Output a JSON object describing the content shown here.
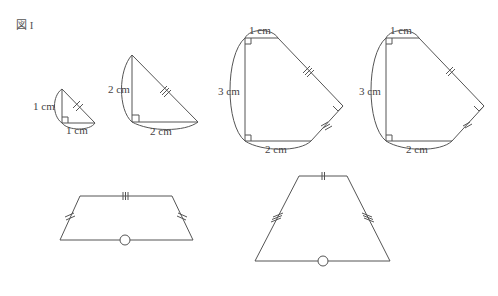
{
  "figure": {
    "title": "図 I",
    "colors": {
      "stroke": "#555555",
      "text": "#444444",
      "background": "#ffffff"
    }
  },
  "shapes": {
    "small_triangle": {
      "leg_vertical": "1 cm",
      "leg_horizontal": "1 cm",
      "hypotenuse_mark": "double-tick"
    },
    "medium_triangle": {
      "leg_vertical": "2 cm",
      "leg_horizontal": "2 cm",
      "hypotenuse_mark": "triple-tick"
    },
    "pentagon_left": {
      "top": "1 cm",
      "left": "3 cm",
      "bottom": "2 cm",
      "slanted_edges_mark": "triple-tick"
    },
    "pentagon_right": {
      "top": "1 cm",
      "left": "3 cm",
      "bottom": "2 cm",
      "slanted_edges_mark": "double-tick"
    },
    "trapezoid_left": {
      "top_mark": "triple-tick",
      "sides_mark": "double-tick",
      "base_mark": "circle"
    },
    "trapezoid_right": {
      "top_mark": "double-tick",
      "sides_mark": "triple-tick",
      "base_mark": "circle"
    }
  }
}
